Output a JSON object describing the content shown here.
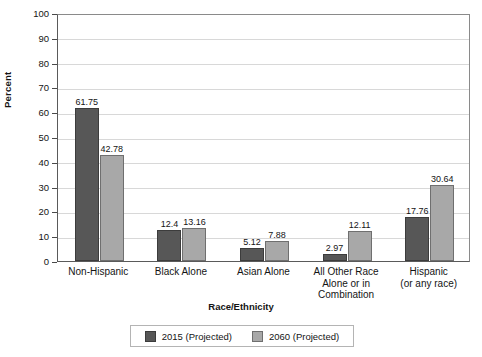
{
  "chart_data": {
    "type": "bar",
    "title": "",
    "xlabel": "Race/Ethnicity",
    "ylabel": "Percent",
    "ylim": [
      0,
      100
    ],
    "ytick_step": 10,
    "yticks": [
      100,
      90,
      80,
      70,
      60,
      50,
      40,
      30,
      20,
      10,
      0
    ],
    "grid": true,
    "legend_position": "bottom",
    "categories": [
      "Non-Hispanic",
      "Black Alone",
      "Asian Alone",
      "All Other Race\nAlone or in\nCombination",
      "Hispanic\n(or any race)"
    ],
    "category_lines": [
      [
        "Non-Hispanic"
      ],
      [
        "Black Alone"
      ],
      [
        "Asian Alone"
      ],
      [
        "All Other Race",
        "Alone or in",
        "Combination"
      ],
      [
        "Hispanic",
        "(or any race)"
      ]
    ],
    "series": [
      {
        "name": "2015 (Projected)",
        "color": "#575757",
        "values": [
          61.75,
          12.4,
          5.12,
          2.97,
          17.76
        ],
        "labels": [
          "61.75",
          "12.4",
          "5.12",
          "2.97",
          "17.76"
        ]
      },
      {
        "name": "2060 (Projected)",
        "color": "#a8a8a8",
        "values": [
          42.78,
          13.16,
          7.88,
          12.11,
          30.64
        ],
        "labels": [
          "42.78",
          "13.16",
          "7.88",
          "12.11",
          "30.64"
        ]
      }
    ]
  },
  "legend": {
    "items": [
      {
        "label": "2015 (Projected)",
        "color": "#575757"
      },
      {
        "label": "2060 (Projected)",
        "color": "#a8a8a8"
      }
    ]
  },
  "colors": {
    "series_2015": "#575757",
    "series_2060": "#a8a8a8",
    "grid": "#d8d8d8",
    "axis": "#5a5a5a",
    "text": "#141414",
    "background": "#ffffff"
  }
}
